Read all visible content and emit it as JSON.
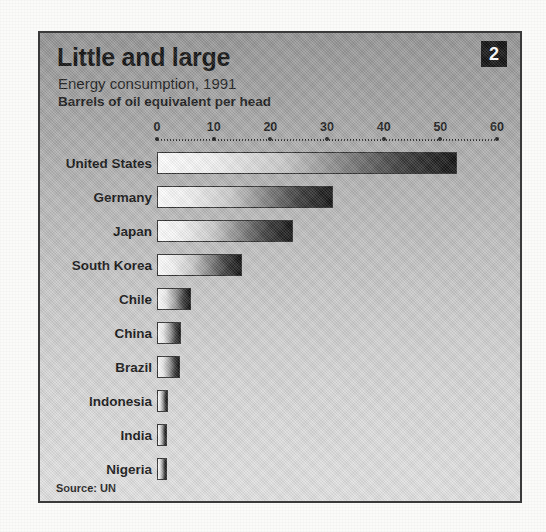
{
  "figure": {
    "badge_number": "2",
    "title": "Little and large",
    "subtitle": "Energy consumption, 1991",
    "units": "Barrels of oil equivalent per head",
    "source": "Source: UN"
  },
  "chart_data": {
    "type": "bar",
    "orientation": "horizontal",
    "title": "Little and large",
    "subtitle": "Energy consumption, 1991",
    "xlabel": "Barrels of oil equivalent per head",
    "ylabel": "",
    "xlim": [
      0,
      60
    ],
    "xticks": [
      0,
      10,
      20,
      30,
      40,
      50,
      60
    ],
    "xtick_labels": [
      "0",
      "10",
      "20",
      "30",
      "40",
      "50",
      "60"
    ],
    "grid": false,
    "legend": null,
    "source": "Source: UN",
    "categories": [
      "United States",
      "Germany",
      "Japan",
      "South Korea",
      "Chile",
      "China",
      "Brazil",
      "Indonesia",
      "India",
      "Nigeria"
    ],
    "values": [
      53,
      31,
      24,
      15,
      6,
      4.3,
      4,
      2,
      1.8,
      1.7
    ],
    "bar_style": {
      "fill": "gradient white-to-black left-to-right",
      "stroke": "#2e2e2e"
    }
  },
  "colors": {
    "panel_top": "#949494",
    "panel_bottom": "#e1e1e1",
    "panel_border": "#3a3a3a",
    "badge_bg": "#121212",
    "badge_text": "#ffffff",
    "text": "#131313",
    "bar_stroke": "#2e2e2e"
  }
}
